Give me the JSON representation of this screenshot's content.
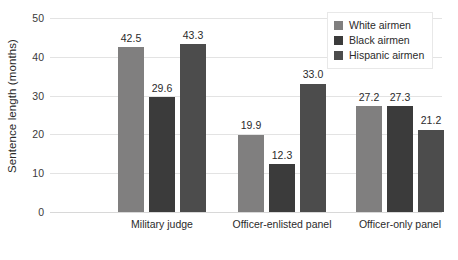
{
  "chart_data": {
    "type": "bar",
    "title": "",
    "subtitle": "",
    "xlabel": "",
    "ylabel": "Sentence length (months)",
    "categories": [
      "Military judge",
      "Officer-enlisted panel",
      "Officer-only panel"
    ],
    "series": [
      {
        "name": "White airmen",
        "color": "#807f7f",
        "values": [
          42.5,
          19.9,
          27.2
        ],
        "labels": [
          "42.5",
          "19.9",
          "27.2"
        ]
      },
      {
        "name": "Black airmen",
        "color": "#3b3b3b",
        "values": [
          29.6,
          12.3,
          27.3
        ],
        "labels": [
          "29.6",
          "12.3",
          "27.3"
        ]
      },
      {
        "name": "Hispanic airmen",
        "color": "#4c4c4c",
        "values": [
          43.3,
          33.0,
          21.2
        ],
        "labels": [
          "43.3",
          "33.0",
          "21.2"
        ]
      }
    ],
    "ylim": [
      0,
      50
    ],
    "yticks": [
      0,
      10,
      20,
      30,
      40,
      50
    ],
    "ytick_labels": [
      "0",
      "10",
      "20",
      "30",
      "40",
      "50"
    ],
    "grid": true,
    "grid_axis": "y",
    "legend_position": "top-right",
    "bar_value_labels": true
  },
  "legend": {
    "items": [
      {
        "label": "White airmen"
      },
      {
        "label": "Black airmen"
      },
      {
        "label": "Hispanic airmen"
      }
    ]
  },
  "axes": {
    "y_title": "Sentence length (months)",
    "y_ticks": [
      "0",
      "10",
      "20",
      "30",
      "40",
      "50"
    ],
    "x_ticks": [
      "Military judge",
      "Officer-enlisted panel",
      "Officer-only panel"
    ]
  }
}
